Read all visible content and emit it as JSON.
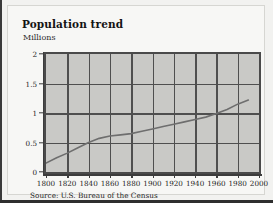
{
  "figure": {
    "title": "Population trend",
    "unit_label": "Millions",
    "source": "Source: U.S. Bureau of the Census",
    "background_color": "#f7f7f5",
    "plot_background_color": "#c9c9c6",
    "gridline_color": "#4f4f4f",
    "series_color": "#6e6e6e"
  },
  "chart_data": {
    "type": "line",
    "title": "Population trend",
    "subtitle": "",
    "xlabel": "",
    "ylabel": "Millions",
    "xlim": [
      1800,
      2000
    ],
    "ylim": [
      0,
      2
    ],
    "grid": true,
    "legend": "none",
    "x_ticks": [
      1800,
      1820,
      1840,
      1860,
      1880,
      1900,
      1920,
      1940,
      1960,
      1980,
      2000
    ],
    "x_tick_labels": [
      "1800",
      "1820",
      "1840",
      "1860",
      "1880",
      "1900",
      "1920",
      "1940",
      "1960",
      "1980",
      "2000"
    ],
    "y_ticks": [
      0,
      0.5,
      1,
      1.5,
      2
    ],
    "y_tick_labels": [
      "0",
      "0.5",
      "1",
      "1.5",
      "2"
    ],
    "series": [
      {
        "name": "Population",
        "x": [
          1800,
          1810,
          1820,
          1830,
          1840,
          1850,
          1860,
          1870,
          1880,
          1890,
          1900,
          1910,
          1920,
          1930,
          1940,
          1950,
          1960,
          1970,
          1980,
          1990
        ],
        "values": [
          0.15,
          0.24,
          0.32,
          0.41,
          0.5,
          0.57,
          0.61,
          0.63,
          0.65,
          0.69,
          0.73,
          0.77,
          0.81,
          0.85,
          0.89,
          0.93,
          0.99,
          1.06,
          1.15,
          1.22
        ]
      }
    ],
    "annotations": [
      "Source: U.S. Bureau of the Census"
    ]
  }
}
